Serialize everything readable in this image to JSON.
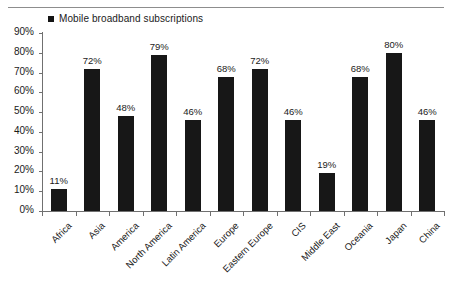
{
  "legend": {
    "marker": "legend-square-marker",
    "label": "Mobile broadband subscriptions"
  },
  "axis": {
    "y_ticks": [
      "0%",
      "10%",
      "20%",
      "30%",
      "40%",
      "50%",
      "60%",
      "70%",
      "80%",
      "90%"
    ]
  },
  "chart_data": {
    "type": "bar",
    "title": "",
    "subtitle": "",
    "xlabel": "",
    "ylabel": "",
    "ylim": [
      0,
      90
    ],
    "ytick_step": 10,
    "grid": false,
    "legend_position": "top-left",
    "bar_color": "#171717",
    "value_suffix": "%",
    "categories": [
      "Africa",
      "Asia",
      "America",
      "North America",
      "Latin America",
      "Europe",
      "Eastern Europe",
      "CIS",
      "Middle East",
      "Oceania",
      "Japan",
      "China"
    ],
    "series": [
      {
        "name": "Mobile broadband subscriptions",
        "values": [
          11,
          72,
          48,
          79,
          46,
          68,
          72,
          46,
          19,
          68,
          80,
          46
        ]
      }
    ],
    "data_labels": [
      "11%",
      "72%",
      "48%",
      "79%",
      "46%",
      "68%",
      "72%",
      "46%",
      "19%",
      "68%",
      "80%",
      "46%"
    ]
  }
}
